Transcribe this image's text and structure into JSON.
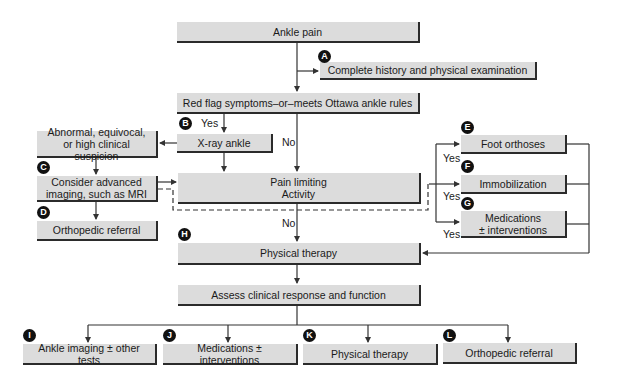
{
  "nodes": {
    "ankle_pain": "Ankle pain",
    "history_exam": "Complete history and physical examination",
    "red_flag": "Red flag symptoms–or–meets Ottawa ankle rules",
    "xray": "X-ray ankle",
    "abnormal_l1": "Abnormal, equivocal,",
    "abnormal_l2": "or high clinical suspicion",
    "consider_l1": "Consider advanced",
    "consider_l2": "imaging, such as MRI",
    "ortho_referral_left": "Orthopedic referral",
    "pain_limiting_l1": "Pain limiting",
    "pain_limiting_l2": "Activity",
    "foot_orthoses": "Foot orthoses",
    "immobilization": "Immobilization",
    "medications_l1": "Medications",
    "medications_l2": "± interventions",
    "physical_therapy": "Physical therapy",
    "assess": "Assess clinical response and function",
    "out_imaging": "Ankle imaging ± other tests",
    "out_medications": "Medications ± interventions",
    "out_pt": "Physical therapy",
    "out_ortho": "Orthopedic referral"
  },
  "edge_labels": {
    "yes_b": "Yes",
    "no_red_flag": "No",
    "no_pain": "No",
    "yes_e": "Yes",
    "yes_f": "Yes",
    "yes_g": "Yes"
  },
  "badges": {
    "a": "A",
    "b": "B",
    "c": "C",
    "d": "D",
    "e": "E",
    "f": "F",
    "g": "G",
    "h": "H",
    "i": "I",
    "j": "J",
    "k": "K",
    "l": "L"
  },
  "colors": {
    "box_fill": "#dcdcdc",
    "box_shadow": "#2b2b2b",
    "line": "#333333",
    "badge": "#111111"
  }
}
